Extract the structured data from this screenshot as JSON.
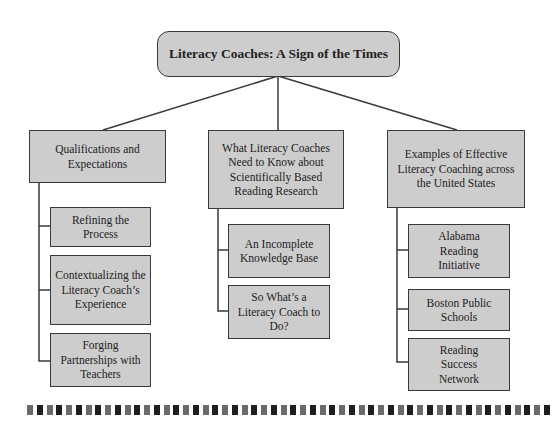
{
  "root": {
    "label": "Literacy Coaches: A Sign of the Times"
  },
  "branches": [
    {
      "label": "Qualifications and Expectations",
      "children": [
        {
          "label": "Refining the Process"
        },
        {
          "label": "Contextualizing the Literacy Coach’s Experience"
        },
        {
          "label": "Forging Partnerships with Teachers"
        }
      ]
    },
    {
      "label": "What Literacy Coaches Need to Know about Scientifically Based Reading Research",
      "children": [
        {
          "label": "An Incomplete Knowledge Base"
        },
        {
          "label": "So What’s a Literacy Coach to Do?"
        }
      ]
    },
    {
      "label": "Examples of Effective Literacy Coaching across the United States",
      "children": [
        {
          "label": "Alabama Reading Initiative"
        },
        {
          "label": "Boston Public Schools"
        },
        {
          "label": "Reading Success Network"
        }
      ]
    }
  ],
  "colors": {
    "box_fill": "#cdcdcd",
    "border": "#3a3a3a",
    "dash_dark": "#1e1e1e",
    "dash_light": "#6a6a6a"
  },
  "dash_count": 54
}
